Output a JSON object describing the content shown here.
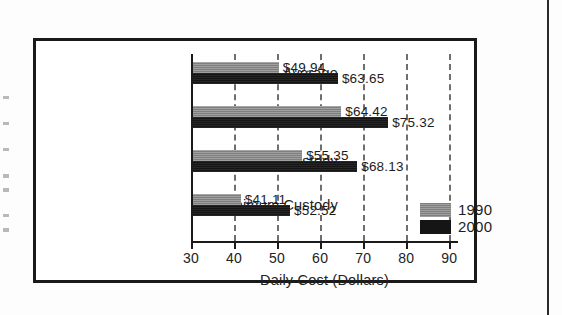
{
  "chart_data": {
    "type": "bar",
    "orientation": "horizontal",
    "title": "",
    "xlabel": "Daily Cost (Dollars)",
    "ylabel": "",
    "xlim": [
      30,
      92
    ],
    "xticks": [
      30,
      40,
      50,
      60,
      70,
      80,
      90
    ],
    "xtick_labels": [
      "30",
      "40",
      "50",
      "60",
      "70",
      "80",
      "90"
    ],
    "gridlines": [
      40,
      50,
      60,
      70,
      80,
      90
    ],
    "grid": true,
    "grid_style": "dashed-vertical",
    "legend_position": "inside-lower-right",
    "categories": [
      "Overall Average",
      "Close Custody",
      "Medium Custody",
      "Minimum Custody"
    ],
    "series": [
      {
        "name": "1990",
        "color": "#8d8d8d",
        "values": [
          49.94,
          64.42,
          55.35,
          41.11
        ],
        "labels": [
          "$49.94",
          "$64.42",
          "$55.35",
          "$41.11"
        ]
      },
      {
        "name": "2000",
        "color": "#151515",
        "values": [
          63.65,
          75.32,
          68.13,
          52.52
        ],
        "labels": [
          "$63.65",
          "$75.32",
          "$68.13",
          "$52.52"
        ]
      }
    ]
  },
  "legend": {
    "items": [
      {
        "label": "1990",
        "swatch_class": "series-1990"
      },
      {
        "label": "2000",
        "swatch_class": "series-2000"
      }
    ]
  },
  "colors": {
    "frame": "#1a1a1a",
    "axis": "#1a1a1a",
    "gridline": "#6e6e6e",
    "series_1990": "#8d8d8d",
    "series_2000": "#151515",
    "text": "#222222",
    "page_background": "#fdfdfd"
  }
}
